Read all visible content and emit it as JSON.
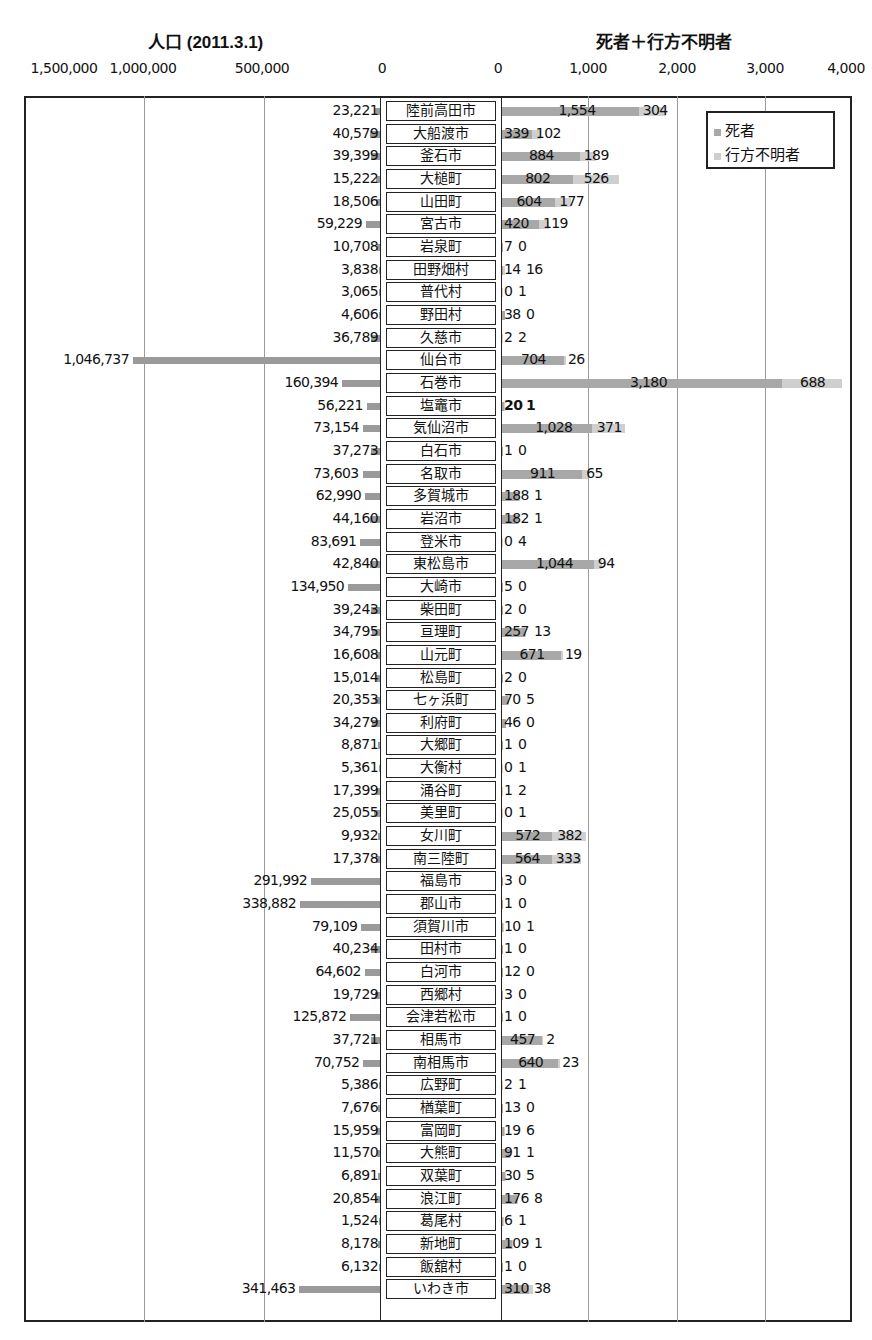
{
  "chart_data": {
    "type": "bar",
    "layout": "back-to-back horizontal bar chart (population left, deaths+missing stacked right)",
    "left_panel": {
      "title": "人口 (2011.3.1)",
      "tick_labels": [
        "1,500,000",
        "1,000,000",
        "500,000",
        "0"
      ],
      "xlim": [
        1500000,
        0
      ]
    },
    "right_panel": {
      "title": "死者＋行方不明者",
      "tick_labels": [
        "0",
        "1,000",
        "2,000",
        "3,000",
        "4,000"
      ],
      "xlim": [
        0,
        4000
      ]
    },
    "legend": {
      "position": "upper right",
      "entries": [
        {
          "label": "死者",
          "color": "#a8a8a8"
        },
        {
          "label": "行方不明者",
          "color": "#cfcfcf"
        }
      ]
    },
    "grid": true,
    "categories": [
      "陸前高田市",
      "大船渡市",
      "釜石市",
      "大槌町",
      "山田町",
      "宮古市",
      "岩泉町",
      "田野畑村",
      "普代村",
      "野田村",
      "久慈市",
      "仙台市",
      "石巻市",
      "塩竈市",
      "気仙沼市",
      "白石市",
      "名取市",
      "多賀城市",
      "岩沼市",
      "登米市",
      "東松島市",
      "大崎市",
      "柴田町",
      "亘理町",
      "山元町",
      "松島町",
      "七ヶ浜町",
      "利府町",
      "大郷町",
      "大衡村",
      "涌谷町",
      "美里町",
      "女川町",
      "南三陸町",
      "福島市",
      "郡山市",
      "須賀川市",
      "田村市",
      "白河市",
      "西郷村",
      "会津若松市",
      "相馬市",
      "南相馬市",
      "広野町",
      "楢葉町",
      "富岡町",
      "大熊町",
      "双葉町",
      "浪江町",
      "葛尾村",
      "新地町",
      "飯舘村",
      "いわき市"
    ],
    "series": [
      {
        "name": "人口",
        "values": [
          23221,
          40579,
          39399,
          15222,
          18506,
          59229,
          10708,
          3838,
          3065,
          4606,
          36789,
          1046737,
          160394,
          56221,
          73154,
          37273,
          73603,
          62990,
          44160,
          83691,
          42840,
          134950,
          39243,
          34795,
          16608,
          15014,
          20353,
          34279,
          8871,
          5361,
          17399,
          25055,
          9932,
          17378,
          291992,
          338882,
          79109,
          40234,
          64602,
          19729,
          125872,
          37721,
          70752,
          5386,
          7676,
          15959,
          11570,
          6891,
          20854,
          1524,
          8178,
          6132,
          341463
        ]
      },
      {
        "name": "死者",
        "values": [
          1554,
          339,
          884,
          802,
          604,
          420,
          7,
          14,
          0,
          38,
          2,
          704,
          3180,
          20,
          1028,
          1,
          911,
          188,
          182,
          0,
          1044,
          5,
          2,
          257,
          671,
          2,
          70,
          46,
          1,
          0,
          1,
          0,
          572,
          564,
          3,
          1,
          10,
          1,
          12,
          3,
          1,
          457,
          640,
          2,
          13,
          19,
          91,
          30,
          176,
          6,
          109,
          1,
          310
        ]
      },
      {
        "name": "行方不明者",
        "values": [
          304,
          102,
          189,
          526,
          177,
          119,
          0,
          16,
          1,
          0,
          2,
          26,
          688,
          1,
          371,
          0,
          65,
          1,
          1,
          4,
          94,
          0,
          0,
          13,
          19,
          0,
          5,
          0,
          0,
          1,
          2,
          1,
          382,
          333,
          0,
          0,
          1,
          0,
          0,
          0,
          0,
          2,
          23,
          1,
          0,
          6,
          1,
          5,
          8,
          1,
          1,
          0,
          38
        ]
      }
    ]
  },
  "rows": [
    {
      "name": "陸前高田市",
      "pop": "23,221",
      "dead": "1,554",
      "missing": "304"
    },
    {
      "name": "大船渡市",
      "pop": "40,579",
      "dead": "339",
      "missing": "102"
    },
    {
      "name": "釜石市",
      "pop": "39,399",
      "dead": "884",
      "missing": "189"
    },
    {
      "name": "大槌町",
      "pop": "15,222",
      "dead": "802",
      "missing": "526"
    },
    {
      "name": "山田町",
      "pop": "18,506",
      "dead": "604",
      "missing": "177"
    },
    {
      "name": "宮古市",
      "pop": "59,229",
      "dead": "420",
      "missing": "119"
    },
    {
      "name": "岩泉町",
      "pop": "10,708",
      "dead": "7",
      "missing": "0"
    },
    {
      "name": "田野畑村",
      "pop": "3,838",
      "dead": "14",
      "missing": "16"
    },
    {
      "name": "普代村",
      "pop": "3,065",
      "dead": "0",
      "missing": "1"
    },
    {
      "name": "野田村",
      "pop": "4,606",
      "dead": "38",
      "missing": "0"
    },
    {
      "name": "久慈市",
      "pop": "36,789",
      "dead": "2",
      "missing": "2"
    },
    {
      "name": "仙台市",
      "pop": "1,046,737",
      "dead": "704",
      "missing": "26"
    },
    {
      "name": "石巻市",
      "pop": "160,394",
      "dead": "3,180",
      "missing": "688"
    },
    {
      "name": "塩竈市",
      "pop": "56,221",
      "dead": "20",
      "missing": "1"
    },
    {
      "name": "気仙沼市",
      "pop": "73,154",
      "dead": "1,028",
      "missing": "371"
    },
    {
      "name": "白石市",
      "pop": "37,273",
      "dead": "1",
      "missing": "0"
    },
    {
      "name": "名取市",
      "pop": "73,603",
      "dead": "911",
      "missing": "65"
    },
    {
      "name": "多賀城市",
      "pop": "62,990",
      "dead": "188",
      "missing": "1"
    },
    {
      "name": "岩沼市",
      "pop": "44,160",
      "dead": "182",
      "missing": "1"
    },
    {
      "name": "登米市",
      "pop": "83,691",
      "dead": "0",
      "missing": "4"
    },
    {
      "name": "東松島市",
      "pop": "42,840",
      "dead": "1,044",
      "missing": "94"
    },
    {
      "name": "大崎市",
      "pop": "134,950",
      "dead": "5",
      "missing": "0"
    },
    {
      "name": "柴田町",
      "pop": "39,243",
      "dead": "2",
      "missing": "0"
    },
    {
      "name": "亘理町",
      "pop": "34,795",
      "dead": "257",
      "missing": "13"
    },
    {
      "name": "山元町",
      "pop": "16,608",
      "dead": "671",
      "missing": "19"
    },
    {
      "name": "松島町",
      "pop": "15,014",
      "dead": "2",
      "missing": "0"
    },
    {
      "name": "七ヶ浜町",
      "pop": "20,353",
      "dead": "70",
      "missing": "5"
    },
    {
      "name": "利府町",
      "pop": "34,279",
      "dead": "46",
      "missing": "0"
    },
    {
      "name": "大郷町",
      "pop": "8,871",
      "dead": "1",
      "missing": "0"
    },
    {
      "name": "大衡村",
      "pop": "5,361",
      "dead": "0",
      "missing": "1"
    },
    {
      "name": "涌谷町",
      "pop": "17,399",
      "dead": "1",
      "missing": "2"
    },
    {
      "name": "美里町",
      "pop": "25,055",
      "dead": "0",
      "missing": "1"
    },
    {
      "name": "女川町",
      "pop": "9,932",
      "dead": "572",
      "missing": "382"
    },
    {
      "name": "南三陸町",
      "pop": "17,378",
      "dead": "564",
      "missing": "333"
    },
    {
      "name": "福島市",
      "pop": "291,992",
      "dead": "3",
      "missing": "0"
    },
    {
      "name": "郡山市",
      "pop": "338,882",
      "dead": "1",
      "missing": "0"
    },
    {
      "name": "須賀川市",
      "pop": "79,109",
      "dead": "10",
      "missing": "1"
    },
    {
      "name": "田村市",
      "pop": "40,234",
      "dead": "1",
      "missing": "0"
    },
    {
      "name": "白河市",
      "pop": "64,602",
      "dead": "12",
      "missing": "0"
    },
    {
      "name": "西郷村",
      "pop": "19,729",
      "dead": "3",
      "missing": "0"
    },
    {
      "name": "会津若松市",
      "pop": "125,872",
      "dead": "1",
      "missing": "0"
    },
    {
      "name": "相馬市",
      "pop": "37,721",
      "dead": "457",
      "missing": "2"
    },
    {
      "name": "南相馬市",
      "pop": "70,752",
      "dead": "640",
      "missing": "23"
    },
    {
      "name": "広野町",
      "pop": "5,386",
      "dead": "2",
      "missing": "1"
    },
    {
      "name": "楢葉町",
      "pop": "7,676",
      "dead": "13",
      "missing": "0"
    },
    {
      "name": "富岡町",
      "pop": "15,959",
      "dead": "19",
      "missing": "6"
    },
    {
      "name": "大熊町",
      "pop": "11,570",
      "dead": "91",
      "missing": "1"
    },
    {
      "name": "双葉町",
      "pop": "6,891",
      "dead": "30",
      "missing": "5"
    },
    {
      "name": "浪江町",
      "pop": "20,854",
      "dead": "176",
      "missing": "8"
    },
    {
      "name": "葛尾村",
      "pop": "1,524",
      "dead": "6",
      "missing": "1"
    },
    {
      "name": "新地町",
      "pop": "8,178",
      "dead": "109",
      "missing": "1"
    },
    {
      "name": "飯舘村",
      "pop": "6,132",
      "dead": "1",
      "missing": "0"
    },
    {
      "name": "いわき市",
      "pop": "341,463",
      "dead": "310",
      "missing": "38"
    }
  ],
  "labels": {
    "left_title": "人口 (2011.3.1)",
    "right_title": "死者＋行方不明者",
    "legend_dead": "死者",
    "legend_missing": "行方不明者",
    "left_ticks": [
      "1,500,000",
      "1,000,000",
      "500,000",
      "0"
    ],
    "right_ticks": [
      "0",
      "1,000",
      "2,000",
      "3,000",
      "4,000"
    ]
  },
  "colors": {
    "population_bar": "#9a9a9a",
    "dead_bar": "#a8a8a8",
    "missing_bar": "#cfcfcf",
    "frame": "#222222",
    "gridline": "#9a9a9a"
  }
}
